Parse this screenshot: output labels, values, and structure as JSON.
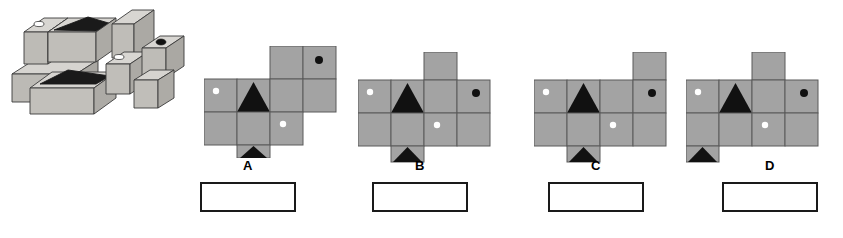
{
  "page": {
    "kind": "visual-reasoning-question",
    "background_color": "#ffffff",
    "ink_color": "#1a1a1a",
    "face_gray": "#a0a0a0",
    "face_gray_dark": "#8f8f8f",
    "groove_black": "#111111",
    "dot_white": "#ffffff",
    "dot_black": "#111111",
    "cube_top_light": "#d8d6d2",
    "cube_front_mid": "#b9b7b2",
    "cube_side_dark": "#a8a6a1"
  },
  "stimulus": {
    "name": "3d-block-assembly",
    "description": "Isometric arrangement of rectangular blocks and cubes with triangular grooves and small circular dots on top faces",
    "marks": [
      {
        "type": "dot-white",
        "face": "top",
        "note": "small light oval on upper-left block top"
      },
      {
        "type": "groove-triangle",
        "face": "top",
        "note": "dark triangular notch on upper long block top"
      },
      {
        "type": "dot-black",
        "face": "top",
        "note": "dark circular hole on right upper cube top"
      },
      {
        "type": "dot-white",
        "face": "top",
        "note": "small light oval on middle cube top"
      },
      {
        "type": "groove-triangle",
        "face": "top",
        "note": "dark triangular notch on lower long block top"
      }
    ]
  },
  "options": [
    {
      "id": "A",
      "label": "A",
      "name": "option-a",
      "net": {
        "cols": 4,
        "rows": 3,
        "cells": [
          {
            "col": 3,
            "row": 0,
            "mark": "none"
          },
          {
            "col": 4,
            "row": 0,
            "mark": "dot-black"
          },
          {
            "col": 1,
            "row": 1,
            "mark": "dot-white"
          },
          {
            "col": 2,
            "row": 1,
            "mark": "triangle"
          },
          {
            "col": 3,
            "row": 1,
            "mark": "none"
          },
          {
            "col": 4,
            "row": 1,
            "mark": "none"
          },
          {
            "col": 1,
            "row": 2,
            "mark": "none"
          },
          {
            "col": 2,
            "row": 2,
            "mark": "none"
          },
          {
            "col": 3,
            "row": 2,
            "mark": "dot-white"
          },
          {
            "col": 2,
            "row": 3,
            "mark": "triangle"
          }
        ]
      },
      "answer_box": {
        "filled": false,
        "value": ""
      }
    },
    {
      "id": "B",
      "label": "B",
      "name": "option-b",
      "net": {
        "cols": 4,
        "rows": 3,
        "cells": [
          {
            "col": 3,
            "row": 0,
            "mark": "none"
          },
          {
            "col": 1,
            "row": 1,
            "mark": "dot-white"
          },
          {
            "col": 2,
            "row": 1,
            "mark": "triangle"
          },
          {
            "col": 3,
            "row": 1,
            "mark": "none"
          },
          {
            "col": 4,
            "row": 1,
            "mark": "dot-black"
          },
          {
            "col": 1,
            "row": 2,
            "mark": "none"
          },
          {
            "col": 2,
            "row": 2,
            "mark": "none"
          },
          {
            "col": 3,
            "row": 2,
            "mark": "dot-white"
          },
          {
            "col": 4,
            "row": 2,
            "mark": "none"
          },
          {
            "col": 2,
            "row": 3,
            "mark": "triangle"
          }
        ]
      },
      "answer_box": {
        "filled": false,
        "value": ""
      }
    },
    {
      "id": "C",
      "label": "C",
      "name": "option-c",
      "net": {
        "cols": 4,
        "rows": 3,
        "cells": [
          {
            "col": 4,
            "row": 0,
            "mark": "none"
          },
          {
            "col": 1,
            "row": 1,
            "mark": "dot-white"
          },
          {
            "col": 2,
            "row": 1,
            "mark": "triangle"
          },
          {
            "col": 3,
            "row": 1,
            "mark": "none"
          },
          {
            "col": 4,
            "row": 1,
            "mark": "dot-black"
          },
          {
            "col": 1,
            "row": 2,
            "mark": "none"
          },
          {
            "col": 2,
            "row": 2,
            "mark": "none"
          },
          {
            "col": 3,
            "row": 2,
            "mark": "dot-white"
          },
          {
            "col": 4,
            "row": 2,
            "mark": "none"
          },
          {
            "col": 2,
            "row": 3,
            "mark": "triangle"
          }
        ]
      },
      "answer_box": {
        "filled": false,
        "value": ""
      }
    },
    {
      "id": "D",
      "label": "D",
      "name": "option-d",
      "net": {
        "cols": 4,
        "rows": 3,
        "cells": [
          {
            "col": 3,
            "row": 0,
            "mark": "none"
          },
          {
            "col": 1,
            "row": 1,
            "mark": "dot-white"
          },
          {
            "col": 2,
            "row": 1,
            "mark": "triangle"
          },
          {
            "col": 3,
            "row": 1,
            "mark": "none"
          },
          {
            "col": 4,
            "row": 1,
            "mark": "dot-black"
          },
          {
            "col": 1,
            "row": 2,
            "mark": "none"
          },
          {
            "col": 2,
            "row": 2,
            "mark": "none"
          },
          {
            "col": 3,
            "row": 2,
            "mark": "dot-white"
          },
          {
            "col": 4,
            "row": 2,
            "mark": "none"
          },
          {
            "col": 1,
            "row": 3,
            "mark": "triangle"
          }
        ]
      },
      "answer_box": {
        "filled": false,
        "value": ""
      }
    }
  ],
  "layout": {
    "option_origins": [
      {
        "id": "A",
        "net_x": 204,
        "net_y": 46,
        "label_x": 200,
        "label_y": 160,
        "box_x": 200,
        "box_y": 182
      },
      {
        "id": "B",
        "net_x": 352,
        "net_y": 52,
        "label_x": 328,
        "label_y": 160,
        "box_x": 372,
        "box_y": 182
      },
      {
        "id": "C",
        "net_x": 500,
        "net_y": 52,
        "label_x": 452,
        "label_y": 160,
        "box_x": 548,
        "box_y": 182
      },
      {
        "id": "D",
        "net_x": 676,
        "net_y": 52,
        "label_x": 588,
        "label_y": 160,
        "box_x": 722,
        "box_y": 182
      }
    ],
    "cell_size": 33,
    "box_w": 96,
    "box_h": 30
  }
}
